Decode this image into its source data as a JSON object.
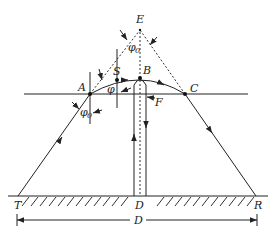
{
  "figure": {
    "labels": {
      "E": "E",
      "S": "S",
      "B": "B",
      "A": "A",
      "C": "C",
      "F": "F",
      "T": "T",
      "D_point": "D",
      "R": "R",
      "D_distance": "D",
      "phi": "φ",
      "phi0_top": "φ",
      "phi0_top_sub": "0",
      "phi0_left": "φ",
      "phi0_left_sub": "0"
    }
  }
}
